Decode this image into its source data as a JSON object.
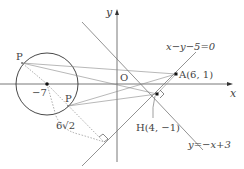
{
  "diagram": {
    "axes": {
      "x_label": "x",
      "y_label": "y",
      "origin_label": "O"
    },
    "circle": {
      "center_label": "−7",
      "center": [
        -7,
        0
      ]
    },
    "points": {
      "A": {
        "label": "A(6, 1)",
        "coords": [
          6,
          1
        ]
      },
      "H": {
        "label": "H(4, −1)",
        "coords": [
          4,
          -1
        ]
      },
      "P_upper": {
        "label": "P"
      },
      "P_lower": {
        "label": "P"
      }
    },
    "lines": {
      "line1": {
        "label": "x−y−5=0"
      },
      "line2": {
        "label": "y=−x+3"
      }
    },
    "distance_label": "6√2",
    "colors": {
      "axis": "#555555",
      "lines": "#777777",
      "circle": "#333333",
      "dotted": "#888888",
      "text": "#444444"
    }
  }
}
